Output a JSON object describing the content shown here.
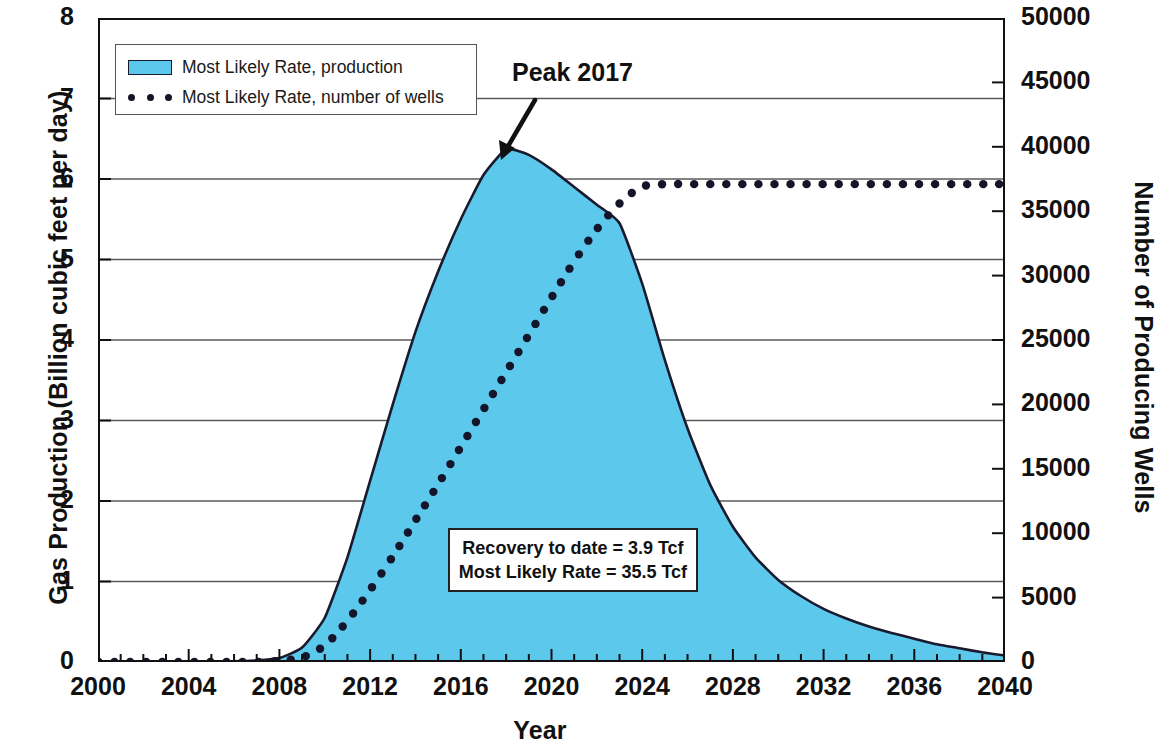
{
  "chart_data": {
    "type": "area",
    "title": "",
    "xlabel": "Year",
    "ylabel": "Gas Production (Billion cubic feet per day)",
    "y2label": "Number of Producing Wells",
    "xlim": [
      2000,
      2040
    ],
    "ylim": [
      0,
      8
    ],
    "y2lim": [
      0,
      50000
    ],
    "grid": true,
    "legend_position": "top-left",
    "x_ticks": [
      "2000",
      "2004",
      "2008",
      "2012",
      "2016",
      "2020",
      "2024",
      "2028",
      "2032",
      "2036",
      "2040"
    ],
    "x_tick_values": [
      2000,
      2004,
      2008,
      2012,
      2016,
      2020,
      2024,
      2028,
      2032,
      2036,
      2040
    ],
    "x_minor_tick_step": 1,
    "y_ticks": [
      "0",
      "1",
      "2",
      "3",
      "4",
      "5",
      "6",
      "7",
      "8"
    ],
    "y_tick_values": [
      0,
      1,
      2,
      3,
      4,
      5,
      6,
      7,
      8
    ],
    "y2_ticks": [
      "0",
      "5000",
      "10000",
      "15000",
      "20000",
      "25000",
      "30000",
      "35000",
      "40000",
      "45000",
      "50000"
    ],
    "y2_tick_values": [
      0,
      5000,
      10000,
      15000,
      20000,
      25000,
      30000,
      35000,
      40000,
      45000,
      50000
    ],
    "x": [
      2000,
      2001,
      2002,
      2003,
      2004,
      2005,
      2006,
      2007,
      2008,
      2009,
      2010,
      2011,
      2012,
      2013,
      2014,
      2015,
      2016,
      2017,
      2018,
      2019,
      2020,
      2021,
      2022,
      2023,
      2024,
      2025,
      2026,
      2027,
      2028,
      2029,
      2030,
      2031,
      2032,
      2033,
      2034,
      2035,
      2036,
      2037,
      2038,
      2039,
      2040
    ],
    "series": [
      {
        "name": "Most Likely Rate, production",
        "type": "area",
        "axis": "left",
        "units": "Billion cubic feet per day",
        "color": "#5BC8EC",
        "line_color": "#1a1a2e",
        "values": [
          0.0,
          0.0,
          0.0,
          0.0,
          0.0,
          0.0,
          0.01,
          0.02,
          0.05,
          0.18,
          0.55,
          1.3,
          2.25,
          3.2,
          4.1,
          4.85,
          5.5,
          6.05,
          6.37,
          6.3,
          6.12,
          5.9,
          5.68,
          5.45,
          4.7,
          3.75,
          2.9,
          2.2,
          1.68,
          1.3,
          1.02,
          0.82,
          0.66,
          0.54,
          0.44,
          0.36,
          0.29,
          0.22,
          0.17,
          0.12,
          0.08
        ]
      },
      {
        "name": "Most Likely Rate, number of wells",
        "type": "scatter-dotted",
        "axis": "right",
        "units": "wells",
        "color": "#14142b",
        "values": [
          0,
          0,
          0,
          0,
          0,
          0,
          0,
          0,
          100,
          350,
          1300,
          3200,
          5600,
          8200,
          11000,
          13800,
          16700,
          19600,
          22500,
          25400,
          28300,
          31100,
          33600,
          35600,
          36900,
          37100,
          37100,
          37100,
          37100,
          37100,
          37100,
          37100,
          37100,
          37100,
          37100,
          37100,
          37100,
          37100,
          37100,
          37100,
          37100
        ]
      }
    ],
    "annotations": [
      {
        "id": "peak",
        "text": "Peak 2017",
        "x": 2018,
        "y": 6.37,
        "style": "arrow"
      },
      {
        "id": "recovery-box",
        "lines": [
          "Recovery to date = 3.9 Tcf",
          "Most Likely Rate = 35.5 Tcf"
        ],
        "style": "boxed"
      }
    ]
  },
  "legend": {
    "items": [
      {
        "label": "Most Likely Rate, production",
        "marker": "swatch",
        "color": "#5BC8EC"
      },
      {
        "label": "Most Likely Rate, number of wells",
        "marker": "dots",
        "color": "#14142b"
      }
    ]
  },
  "annotations": {
    "peak_label": "Peak 2017",
    "callout_line1": "Recovery to date = 3.9 Tcf",
    "callout_line2": "Most Likely Rate = 35.5 Tcf"
  },
  "axes": {
    "left_title": "Gas Production (Billion cubic feet per day)",
    "right_title": "Number of Producing Wells",
    "x_title": "Year"
  }
}
